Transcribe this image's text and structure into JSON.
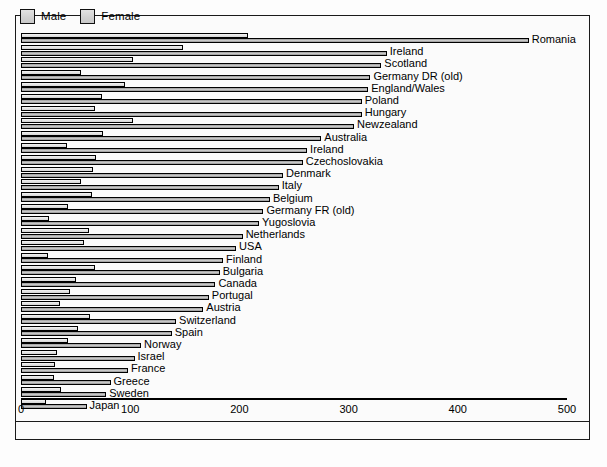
{
  "chart_data": {
    "type": "bar",
    "orientation": "horizontal",
    "title": "",
    "xlabel": "",
    "ylabel": "",
    "xlim": [
      0,
      500
    ],
    "xticks": [
      "0",
      "100",
      "200",
      "300",
      "400",
      "500"
    ],
    "grid": false,
    "legend": {
      "position": "top-left",
      "entries": [
        {
          "name": "Male",
          "color": "#a8a8a8"
        },
        {
          "name": "Female",
          "color": "#e4e4e4"
        }
      ]
    },
    "series": [
      {
        "name": "Female",
        "values": [
          208,
          148,
          103,
          55,
          95,
          74,
          68,
          103,
          75,
          42,
          69,
          66,
          55,
          65,
          43,
          26,
          62,
          58,
          25,
          68,
          50,
          45,
          36,
          63,
          52,
          43,
          33,
          31
        ]
      },
      {
        "name": "Male",
        "values": [
          465,
          335,
          330,
          320,
          318,
          312,
          312,
          305,
          275,
          262,
          258,
          240,
          236,
          228,
          222,
          218,
          203,
          197,
          185,
          182,
          178,
          172,
          167,
          142,
          138,
          110,
          104,
          98
        ]
      }
    ],
    "categories": [
      "Romania",
      "Ireland",
      "Scotland",
      "Germany DR (old)",
      "England/Wales",
      "Poland",
      "Hungary",
      "Newzealand",
      "Australia",
      "Ireland",
      "Czechoslovakia",
      "Denmark",
      "Italy",
      "Belgium",
      "Germany FR (old)",
      "Yugoslovia",
      "Netherlands",
      "USA",
      "Finland",
      "Bulgaria",
      "Canada",
      "Portugal",
      "Austria",
      "Switzerland",
      "Spain",
      "Norway",
      "Israel",
      "France"
    ],
    "extra_categories": [
      {
        "label": "Greece",
        "female": 30,
        "male": 82
      },
      {
        "label": "Sweden",
        "female": 37,
        "male": 78
      },
      {
        "label": "Japan",
        "female": 23,
        "male": 60
      }
    ]
  },
  "axis": {
    "ticks": [
      {
        "label": "0",
        "value": 0
      },
      {
        "label": "100",
        "value": 100
      },
      {
        "label": "200",
        "value": 200
      },
      {
        "label": "300",
        "value": 300
      },
      {
        "label": "400",
        "value": 400
      },
      {
        "label": "500",
        "value": 500
      }
    ]
  }
}
